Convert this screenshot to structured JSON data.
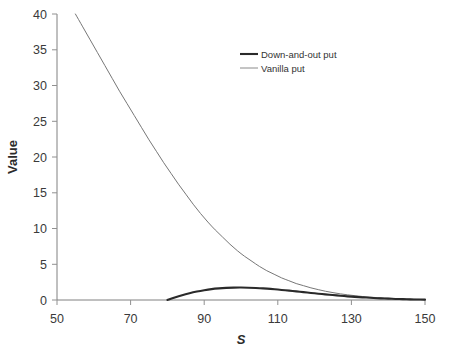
{
  "chart_data": {
    "type": "line",
    "title": "",
    "xlabel": "S",
    "ylabel": "Value",
    "xlim": [
      50,
      150
    ],
    "ylim": [
      0,
      40
    ],
    "xticks": [
      50,
      70,
      90,
      110,
      130,
      150
    ],
    "yticks": [
      0,
      5,
      10,
      15,
      20,
      25,
      30,
      35,
      40
    ],
    "grid": false,
    "legend_position": "top-center-right",
    "series": [
      {
        "name": "Down-and-out put",
        "color": "#2a2a2a",
        "linewidth": "thick",
        "x": [
          80,
          82,
          84,
          86,
          88,
          90,
          92,
          94,
          96,
          98,
          100,
          102,
          104,
          106,
          108,
          110,
          112,
          114,
          116,
          118,
          120,
          122,
          124,
          126,
          128,
          130,
          132,
          134,
          136,
          138,
          140,
          142,
          144,
          146,
          148,
          150
        ],
        "values": [
          0.0,
          0.36,
          0.68,
          0.95,
          1.18,
          1.37,
          1.52,
          1.62,
          1.69,
          1.73,
          1.74,
          1.72,
          1.68,
          1.62,
          1.55,
          1.46,
          1.36,
          1.26,
          1.15,
          1.04,
          0.94,
          0.83,
          0.73,
          0.64,
          0.55,
          0.47,
          0.4,
          0.34,
          0.28,
          0.23,
          0.19,
          0.15,
          0.12,
          0.09,
          0.07,
          0.05
        ]
      },
      {
        "name": "Vanilla put",
        "color": "#777777",
        "linewidth": "thin",
        "x": [
          55,
          57,
          59,
          61,
          63,
          65,
          67,
          69,
          71,
          73,
          75,
          77,
          79,
          81,
          83,
          85,
          87,
          89,
          91,
          93,
          95,
          97,
          99,
          101,
          103,
          105,
          107,
          109,
          111,
          113,
          115,
          117,
          119,
          121,
          123,
          125,
          127,
          129,
          131,
          133,
          135,
          137,
          139,
          141,
          143,
          145,
          147,
          150
        ],
        "values": [
          40.0,
          38.2,
          36.4,
          34.6,
          32.8,
          31.0,
          29.2,
          27.5,
          25.8,
          24.1,
          22.4,
          20.8,
          19.2,
          17.7,
          16.2,
          14.8,
          13.4,
          12.1,
          10.9,
          9.8,
          8.8,
          7.8,
          6.9,
          6.1,
          5.4,
          4.7,
          4.1,
          3.6,
          3.1,
          2.7,
          2.3,
          2.0,
          1.7,
          1.45,
          1.22,
          1.03,
          0.86,
          0.72,
          0.6,
          0.49,
          0.4,
          0.33,
          0.27,
          0.22,
          0.17,
          0.13,
          0.1,
          0.06
        ]
      }
    ],
    "legend": [
      "Down-and-out put",
      "Vanilla put"
    ]
  },
  "axes": {
    "y_label": "Value",
    "x_label": "S",
    "y_tick_labels": [
      "40",
      "35",
      "30",
      "25",
      "20",
      "15",
      "10",
      "5",
      "0"
    ],
    "x_tick_labels": [
      "50",
      "70",
      "90",
      "110",
      "130",
      "150"
    ]
  },
  "legend": {
    "entries": [
      {
        "label": "Down-and-out put"
      },
      {
        "label": "Vanilla put"
      }
    ]
  }
}
